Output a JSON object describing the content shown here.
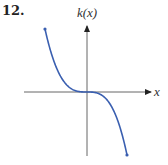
{
  "problem": {
    "number": "12."
  },
  "chart_data": {
    "type": "line",
    "title": "",
    "function_label": "k(x)",
    "xlabel": "x",
    "ylabel": "k(x)",
    "grid": false,
    "ticks": false,
    "series": [
      {
        "name": "k(x)",
        "color": "#3a5fb0",
        "points_px": [
          [
            45,
            29
          ],
          [
            60,
            60
          ],
          [
            75,
            85
          ],
          [
            87,
            92
          ],
          [
            100,
            98
          ],
          [
            115,
            120
          ],
          [
            127,
            155
          ]
        ],
        "shape": "-x^3"
      }
    ],
    "colors": {
      "curve": "#3a5fb0",
      "axes": "#555555"
    }
  }
}
